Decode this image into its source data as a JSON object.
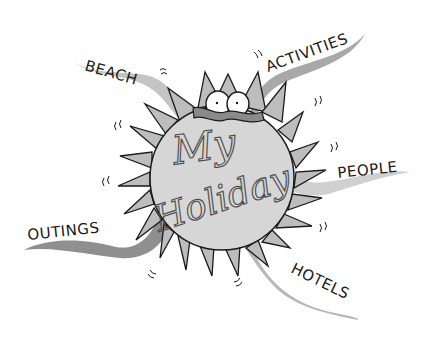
{
  "diagram": {
    "title_line1": "My",
    "title_line2": "Holiday",
    "labels": {
      "beach": "BEACH",
      "activities": "ACTIVITIES",
      "people": "PEOPLE",
      "hotels": "HOTELS",
      "outings": "OUTINGS"
    },
    "colors": {
      "sun_face": "#d6d6d6",
      "sun_rays": "#bdbdbd",
      "ribbon_light": "#c4c4c4",
      "ribbon_dark": "#8f8f8f",
      "outline": "#1a1a1a",
      "background": "#ffffff"
    }
  }
}
